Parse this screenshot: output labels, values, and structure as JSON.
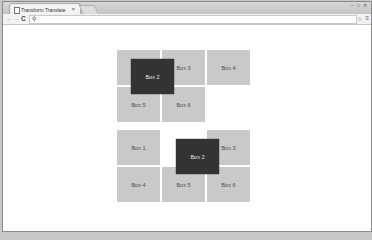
{
  "browser": {
    "tab": {
      "title": "Transform Translate",
      "close": "×"
    },
    "window_controls": "─ □ ✕",
    "nav": {
      "back": "←",
      "forward": "→",
      "reload": "C"
    },
    "omnibox": {
      "value": "",
      "search_icon": "🔍"
    },
    "star": "☆",
    "menu": "≡"
  },
  "page": {
    "grid_top": {
      "boxes": [
        {
          "label": "Box 3"
        },
        {
          "label": "Box 4"
        },
        {
          "label": "Box 5"
        },
        {
          "label": "Box 6"
        },
        {
          "label": "Box 2"
        }
      ]
    },
    "grid_bottom": {
      "boxes": [
        {
          "label": "Box 1"
        },
        {
          "label": "Box 3"
        },
        {
          "label": "Box 4"
        },
        {
          "label": "Box 5"
        },
        {
          "label": "Box 6"
        },
        {
          "label": "Box 2"
        }
      ]
    }
  },
  "colors": {
    "box": "#c9c9c9",
    "box_translated": "#333333"
  }
}
